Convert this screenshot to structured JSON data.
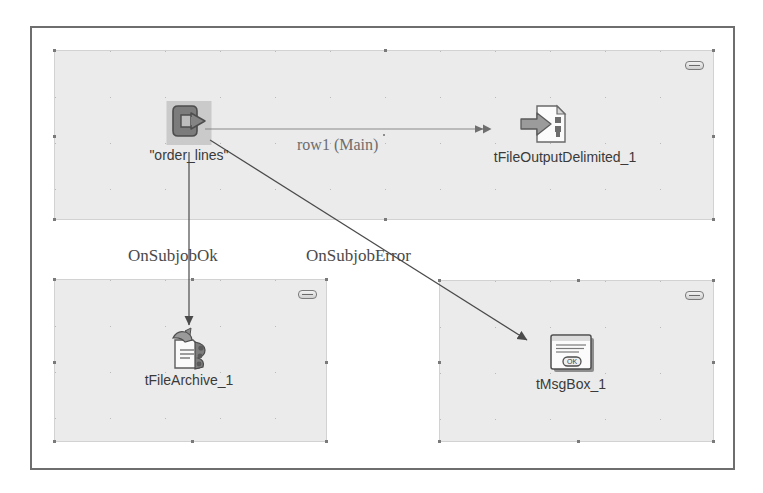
{
  "canvas": {
    "name": "job-designer-canvas",
    "background_color": "#ffffff",
    "frame_border_color": "#6e6e6e",
    "subjob_fill_color": "#ebebeb",
    "subjob_border_color": "#d2d2d2"
  },
  "subjobs": [
    {
      "id": "subjob-top",
      "collapse_widget": true
    },
    {
      "id": "subjob-bottom-left",
      "collapse_widget": true
    },
    {
      "id": "subjob-bottom-right",
      "collapse_widget": true
    }
  ],
  "components": [
    {
      "id": "component-order-lines",
      "label": "\"order_lines\"",
      "icon": "input-arrow-icon",
      "selected": true
    },
    {
      "id": "component-tfileoutputdelimited",
      "label": "tFileOutputDelimited_1",
      "icon": "file-output-delimited-icon",
      "selected": false
    },
    {
      "id": "component-tfilearchive",
      "label": "tFileArchive_1",
      "icon": "file-archive-icon",
      "selected": false
    },
    {
      "id": "component-tmsgbox",
      "label": "tMsgBox_1",
      "icon": "message-box-icon",
      "selected": false
    }
  ],
  "connections": [
    {
      "id": "connection-row1",
      "label": "row1 (Main)",
      "from": "component-order-lines",
      "to": "component-tfileoutputdelimited",
      "type": "main"
    },
    {
      "id": "connection-onsubjobok",
      "label": "OnSubjobOk",
      "from": "component-order-lines",
      "to": "component-tfilearchive",
      "type": "trigger"
    },
    {
      "id": "connection-onsubjoberror",
      "label": "OnSubjobError",
      "from": "component-order-lines",
      "to": "component-tmsgbox",
      "type": "trigger"
    }
  ]
}
